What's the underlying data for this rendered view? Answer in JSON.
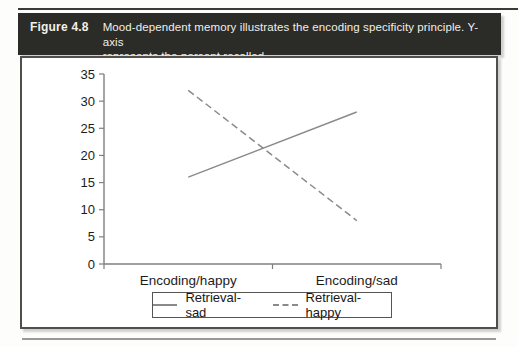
{
  "figure": {
    "label": "Figure 4.8",
    "caption_lines": [
      "Mood-dependent memory illustrates the encoding specificity principle. Y-axis",
      "represents the percent recalled."
    ]
  },
  "chart_data": {
    "type": "line",
    "title": "",
    "xlabel": "",
    "ylabel": "percent recalled",
    "categories": [
      "Encoding/happy",
      "Encoding/sad"
    ],
    "series": [
      {
        "name": "Retrieval-sad",
        "style": "solid",
        "values": [
          16,
          28
        ]
      },
      {
        "name": "Retrieval-happy",
        "style": "dashed",
        "values": [
          32,
          8
        ]
      }
    ],
    "ylim": [
      0,
      35
    ],
    "yticks": [
      0,
      5,
      10,
      15,
      20,
      25,
      30,
      35
    ],
    "grid": false,
    "legend_position": "bottom",
    "line_color": "#8a8a8a",
    "axis_color": "#7f7f7f",
    "tick_label_color": "#1c1c1c"
  },
  "colors": {
    "header_bg": "#2b2b28",
    "header_text": "#f2efe8",
    "panel_border": "#4f4f4d",
    "rule": "#3a3a38"
  }
}
